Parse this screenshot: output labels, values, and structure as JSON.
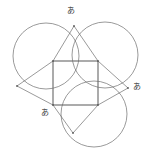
{
  "figure": {
    "stroke_color": "#6e6e6e",
    "label_color": "#3a3a3a",
    "background_color": "#ffffff",
    "stroke_width": 0.7,
    "width": 152,
    "height": 157
  },
  "labels": [
    {
      "id": "label-top",
      "text": "あ",
      "x": 71,
      "y": 11
    },
    {
      "id": "label-right",
      "text": "あ",
      "x": 137,
      "y": 87
    },
    {
      "id": "label-bottom-left",
      "text": "あ",
      "x": 45,
      "y": 113
    }
  ],
  "geometry": {
    "square": {
      "name": "central-square",
      "points": "53,61 98,61 98,105 53,105",
      "vertices": [
        {
          "name": "square-top-left",
          "x": 53,
          "y": 61
        },
        {
          "name": "square-top-right",
          "x": 98,
          "y": 61
        },
        {
          "name": "square-bottom-right",
          "x": 98,
          "y": 105
        },
        {
          "name": "square-bottom-left",
          "x": 53,
          "y": 105
        }
      ]
    },
    "apexes": [
      {
        "name": "apex-top",
        "x": 74,
        "y": 26
      },
      {
        "name": "apex-right",
        "x": 128,
        "y": 88
      },
      {
        "name": "apex-bottom",
        "x": 73,
        "y": 133
      },
      {
        "name": "apex-left",
        "x": 17,
        "y": 86
      }
    ],
    "triangles": [
      {
        "name": "triangle-top",
        "points": "53,61 98,61 74,26"
      },
      {
        "name": "triangle-right",
        "points": "98,61 98,105 128,88"
      },
      {
        "name": "triangle-bottom",
        "points": "53,105 98,105 73,133"
      },
      {
        "name": "triangle-left",
        "points": "53,61 53,105 17,86"
      }
    ],
    "circles": [
      {
        "name": "circle-upper-left",
        "cx": 46,
        "cy": 56,
        "r": 33
      },
      {
        "name": "circle-upper-right",
        "cx": 105,
        "cy": 55,
        "r": 33
      },
      {
        "name": "circle-bottom",
        "cx": 94,
        "cy": 114,
        "r": 33
      }
    ]
  }
}
